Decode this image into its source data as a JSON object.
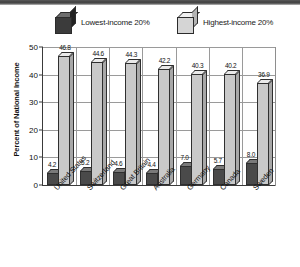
{
  "legend": {
    "items": [
      {
        "label": "Lowest-income 20%",
        "icon": "cube-dark-icon",
        "color": "#3b3b3b"
      },
      {
        "label": "Highest-income 20%",
        "icon": "cube-light-icon",
        "color": "#d5d5d5"
      }
    ]
  },
  "axis": {
    "ylabel": "Percent of National Income",
    "yticks": [
      "0",
      "10",
      "20",
      "30",
      "40",
      "50"
    ]
  },
  "chart_data": {
    "type": "bar",
    "title": "",
    "xlabel": "",
    "ylabel": "Percent of National Income",
    "ylim": [
      0,
      50
    ],
    "yticks": [
      0,
      10,
      20,
      30,
      40,
      50
    ],
    "grid": true,
    "legend_position": "top",
    "categories": [
      "United States",
      "Switzerland",
      "Great Britain",
      "Australia",
      "Germany",
      "Canada",
      "Sweden"
    ],
    "series": [
      {
        "name": "Lowest-income 20%",
        "color": "#3b3b3b",
        "values": [
          4.2,
          5.2,
          4.6,
          4.4,
          7.0,
          5.7,
          8.0
        ]
      },
      {
        "name": "Highest-income 20%",
        "color": "#c9c9c9",
        "values": [
          46.8,
          44.6,
          44.3,
          42.2,
          40.3,
          40.2,
          36.9
        ]
      }
    ],
    "value_labels": {
      "Lowest-income 20%": [
        "4.2",
        "5.2",
        "4.6",
        "4.4",
        "7.0",
        "5.7",
        "8.0"
      ],
      "Highest-income 20%": [
        "46.8",
        "44.6",
        "44.3",
        "42.2",
        "40.3",
        "40.2",
        "36.9"
      ]
    }
  }
}
